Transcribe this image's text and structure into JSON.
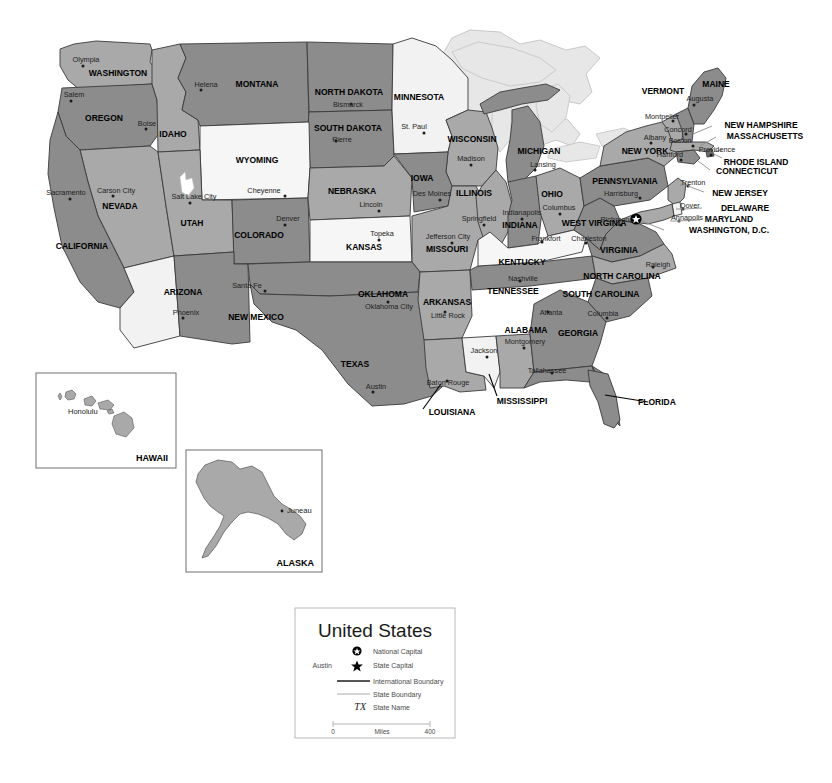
{
  "map": {
    "title": "United States",
    "colors": {
      "state_dark": "#8c8c8c",
      "state_light": "#a9a9a9",
      "state_pale": "#d8d8d8",
      "state_white": "#f2f2f2",
      "lake": "#e6e6e6",
      "water_white": "#ffffff",
      "border": "#3a3a3a",
      "outline": "#1e1e1e",
      "inset_fill": "#a9a9a9",
      "inset_border": "#6e6e6e",
      "legend_border": "#b9b9b9"
    },
    "states": [
      {
        "name": "WASHINGTON",
        "capital": "Olympia",
        "label_x": 118,
        "label_y": 76,
        "cap_x": 86,
        "cap_y": 62,
        "font": 8.5
      },
      {
        "name": "OREGON",
        "capital": "Salem",
        "label_x": 104,
        "label_y": 121,
        "cap_x": 74,
        "cap_y": 97,
        "font": 8.5
      },
      {
        "name": "IDAHO",
        "capital": "Boise",
        "label_x": 173,
        "label_y": 137,
        "cap_x": 147,
        "cap_y": 126,
        "font": 8.5
      },
      {
        "name": "MONTANA",
        "capital": "Helena",
        "label_x": 257,
        "label_y": 87,
        "cap_x": 206,
        "cap_y": 87,
        "font": 8.5
      },
      {
        "name": "NORTH DAKOTA",
        "capital": "Bismarck",
        "label_x": 349,
        "label_y": 95,
        "cap_x": 348,
        "cap_y": 107,
        "font": 8.5
      },
      {
        "name": "SOUTH DAKOTA",
        "capital": "Pierre",
        "label_x": 348,
        "label_y": 131,
        "cap_x": 342,
        "cap_y": 142,
        "font": 8.5
      },
      {
        "name": "MINNESOTA",
        "capital": "St. Paul",
        "label_x": 419,
        "label_y": 100,
        "cap_x": 414,
        "cap_y": 129,
        "font": 8.5
      },
      {
        "name": "WISCONSIN",
        "capital": "Madison",
        "label_x": 472,
        "label_y": 142,
        "cap_x": 471,
        "cap_y": 161,
        "font": 8.5
      },
      {
        "name": "MICHIGAN",
        "capital": "Lansing",
        "label_x": 539,
        "label_y": 154,
        "cap_x": 543,
        "cap_y": 167,
        "font": 8.5
      },
      {
        "name": "IOWA",
        "capital": "Des Moines",
        "label_x": 422,
        "label_y": 181,
        "cap_x": 432,
        "cap_y": 196,
        "font": 8.5
      },
      {
        "name": "ILLINOIS",
        "capital": "Springfield",
        "label_x": 474,
        "label_y": 196,
        "cap_x": 479,
        "cap_y": 221,
        "font": 8.5
      },
      {
        "name": "INDIANA",
        "capital": "Indianapolis",
        "label_x": 520,
        "label_y": 228,
        "cap_x": 522,
        "cap_y": 215,
        "font": 8.5
      },
      {
        "name": "OHIO",
        "capital": "Columbus",
        "label_x": 552,
        "label_y": 197,
        "cap_x": 559,
        "cap_y": 210,
        "font": 8.5
      },
      {
        "name": "NEBRASKA",
        "capital": "Lincoln",
        "label_x": 352,
        "label_y": 194,
        "cap_x": 371,
        "cap_y": 207,
        "font": 8.5
      },
      {
        "name": "KANSAS",
        "capital": "Topeka",
        "label_x": 364,
        "label_y": 250,
        "cap_x": 382,
        "cap_y": 236,
        "font": 8.5
      },
      {
        "name": "MISSOURI",
        "capital": "Jefferson City",
        "label_x": 447,
        "label_y": 252,
        "cap_x": 448,
        "cap_y": 239,
        "font": 8.5
      },
      {
        "name": "WYOMING",
        "capital": "Cheyenne",
        "label_x": 257,
        "label_y": 163,
        "cap_x": 264,
        "cap_y": 193,
        "font": 8.5
      },
      {
        "name": "COLORADO",
        "capital": "Denver",
        "label_x": 259,
        "label_y": 238,
        "cap_x": 288,
        "cap_y": 221,
        "font": 8.5
      },
      {
        "name": "UTAH",
        "capital": "Salt Lake City",
        "label_x": 192,
        "label_y": 226,
        "cap_x": 194,
        "cap_y": 199,
        "font": 8.5
      },
      {
        "name": "NEVADA",
        "capital": "Carson City",
        "label_x": 120,
        "label_y": 209,
        "cap_x": 116,
        "cap_y": 193,
        "font": 8.5
      },
      {
        "name": "CALIFORNIA",
        "capital": "Sacramento",
        "label_x": 82,
        "label_y": 249,
        "cap_x": 66,
        "cap_y": 195,
        "font": 8.5
      },
      {
        "name": "ARIZONA",
        "capital": "Phoenix",
        "label_x": 183,
        "label_y": 295,
        "cap_x": 186,
        "cap_y": 315,
        "font": 8.5
      },
      {
        "name": "NEW MEXICO",
        "capital": "Santa Fe",
        "label_x": 256,
        "label_y": 320,
        "cap_x": 247,
        "cap_y": 288,
        "font": 8.5
      },
      {
        "name": "OKLAHOMA",
        "capital": "Oklahoma City",
        "label_x": 383,
        "label_y": 297,
        "cap_x": 389,
        "cap_y": 309,
        "font": 8.5
      },
      {
        "name": "TEXAS",
        "capital": "Austin",
        "label_x": 355,
        "label_y": 367,
        "cap_x": 376,
        "cap_y": 389,
        "font": 8.5
      },
      {
        "name": "ARKANSAS",
        "capital": "Little Rock",
        "label_x": 447,
        "label_y": 305,
        "cap_x": 448,
        "cap_y": 318,
        "font": 8.5
      },
      {
        "name": "LOUISIANA",
        "capital": "Baton Rouge",
        "label_x": 452,
        "label_y": 415,
        "cap_x": 448,
        "cap_y": 385,
        "font": 8.5
      },
      {
        "name": "MISSISSIPPI",
        "capital": "Jackson",
        "label_x": 522,
        "label_y": 404,
        "cap_x": 484,
        "cap_y": 353,
        "font": 8.5
      },
      {
        "name": "ALABAMA",
        "capital": "Montgomery",
        "label_x": 526,
        "label_y": 333,
        "cap_x": 525,
        "cap_y": 344,
        "font": 8.5
      },
      {
        "name": "GEORGIA",
        "capital": "Atlanta",
        "label_x": 578,
        "label_y": 336,
        "cap_x": 551,
        "cap_y": 315,
        "font": 8.5
      },
      {
        "name": "FLORIDA",
        "capital": "Tallahassee",
        "label_x": 657,
        "label_y": 405,
        "cap_x": 547,
        "cap_y": 373,
        "font": 8.5
      },
      {
        "name": "TENNESSEE",
        "capital": "Nashville",
        "label_x": 513,
        "label_y": 294,
        "cap_x": 523,
        "cap_y": 281,
        "font": 8.5
      },
      {
        "name": "KENTUCKY",
        "capital": "Frankfort",
        "label_x": 522,
        "label_y": 265,
        "cap_x": 546,
        "cap_y": 241,
        "font": 8.5
      },
      {
        "name": "WEST VIRGINIA",
        "capital": "Charleston",
        "label_x": 594,
        "label_y": 226,
        "cap_x": 589,
        "cap_y": 241,
        "font": 8.5
      },
      {
        "name": "VIRGINIA",
        "capital": "Richmond",
        "label_x": 619,
        "label_y": 253,
        "cap_x": 617,
        "cap_y": 222,
        "font": 8.5
      },
      {
        "name": "NORTH CAROLINA",
        "capital": "Raleigh",
        "label_x": 622,
        "label_y": 279,
        "cap_x": 658,
        "cap_y": 267,
        "font": 8.5
      },
      {
        "name": "SOUTH CAROLINA",
        "capital": "Columbia",
        "label_x": 601,
        "label_y": 297,
        "cap_x": 603,
        "cap_y": 316,
        "font": 8.5
      },
      {
        "name": "PENNSYLVANIA",
        "capital": "Harrisburg",
        "label_x": 625,
        "label_y": 184,
        "cap_x": 621,
        "cap_y": 196,
        "font": 8.5
      },
      {
        "name": "NEW YORK",
        "capital": "Albany",
        "label_x": 645,
        "label_y": 154,
        "cap_x": 655,
        "cap_y": 140,
        "font": 8.5
      },
      {
        "name": "VERMONT",
        "capital": "Montpelier",
        "label_x": 663,
        "label_y": 94,
        "cap_x": 662,
        "cap_y": 119,
        "font": 8.5
      },
      {
        "name": "MAINE",
        "capital": "Augusta",
        "label_x": 716,
        "label_y": 87,
        "cap_x": 700,
        "cap_y": 101,
        "font": 8.5
      },
      {
        "name": "NEW HAMPSHIRE",
        "capital": "Concord",
        "label_x": 761,
        "label_y": 128,
        "cap_x": 678,
        "cap_y": 132,
        "font": 8.5
      },
      {
        "name": "MASSACHUSETTS",
        "capital": "Boston",
        "label_x": 765,
        "label_y": 139,
        "cap_x": 680,
        "cap_y": 143,
        "font": 8.5
      },
      {
        "name": "RHODE ISLAND",
        "capital": "Providence",
        "label_x": 756,
        "label_y": 165,
        "cap_x": 717,
        "cap_y": 152,
        "font": 8.5
      },
      {
        "name": "CONNECTICUT",
        "capital": "Hartford",
        "label_x": 747,
        "label_y": 174,
        "cap_x": 670,
        "cap_y": 157,
        "font": 8.5
      },
      {
        "name": "NEW JERSEY",
        "capital": "Trenton",
        "label_x": 740,
        "label_y": 196,
        "cap_x": 693,
        "cap_y": 185,
        "font": 8.5
      },
      {
        "name": "DELAWARE",
        "capital": "Dover",
        "label_x": 745,
        "label_y": 211,
        "cap_x": 690,
        "cap_y": 208,
        "font": 8.5
      },
      {
        "name": "MARYLAND",
        "capital": "Annapolis",
        "label_x": 729,
        "label_y": 222,
        "cap_x": 687,
        "cap_y": 220,
        "font": 8.5
      },
      {
        "name": "WASHINGTON, D.C.",
        "capital": "",
        "label_x": 729,
        "label_y": 233,
        "cap_x": 0,
        "cap_y": 0,
        "font": 8.5
      }
    ],
    "insets": [
      {
        "name": "HAWAII",
        "capital": "Honolulu"
      },
      {
        "name": "ALASKA",
        "capital": "Juneau"
      }
    ],
    "national_capital": {
      "name": "Washington, D.C.",
      "x": 636,
      "y": 219
    }
  },
  "legend": {
    "title": "United States",
    "items": [
      {
        "symbol": "national-capital-icon",
        "label": "National Capital",
        "sample": ""
      },
      {
        "symbol": "state-capital-icon",
        "label": "State Capital",
        "sample": "Austin"
      },
      {
        "symbol": "international-boundary-icon",
        "label": "International Boundary",
        "sample": ""
      },
      {
        "symbol": "state-boundary-icon",
        "label": "State Boundary",
        "sample": ""
      },
      {
        "symbol": "state-name-icon",
        "label": "State Name",
        "sample": "TX"
      }
    ],
    "scale": {
      "min": "0",
      "max": "400",
      "unit": "Miles"
    }
  }
}
